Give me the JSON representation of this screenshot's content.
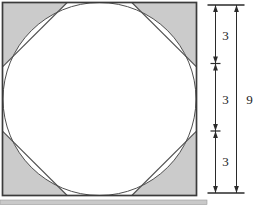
{
  "figure": {
    "square_side": 9,
    "side_segments": [
      3,
      3,
      3
    ],
    "dimension_labels": {
      "segment_1": "3",
      "segment_2": "3",
      "segment_3": "3",
      "total": "9"
    },
    "colors": {
      "shaded_corner": "#cbcbcb",
      "square_outline": "#3b3b3b",
      "curve_line": "#4f4f4f",
      "dimension_line": "#2a2a2a",
      "label_text": "#1c1c1c",
      "background": "#ffffff",
      "artifact_strip": "#c9c9c9"
    }
  }
}
